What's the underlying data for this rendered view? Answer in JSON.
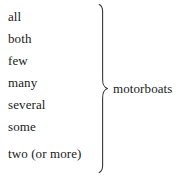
{
  "figure": {
    "type": "bracket-grouping-diagram",
    "background_color": "#ffffff",
    "text_color": "#1a1a1a"
  },
  "list": {
    "items": [
      {
        "label": "all"
      },
      {
        "label": "both"
      },
      {
        "label": "few"
      },
      {
        "label": "many"
      },
      {
        "label": "several"
      },
      {
        "label": "some"
      },
      {
        "label": "two (or more)"
      }
    ]
  },
  "brace": {
    "icon": "right-pointing-curly-brace-icon",
    "orientation": "right",
    "stroke_color": "#3a3a3a"
  },
  "group": {
    "label": "motorboats"
  }
}
